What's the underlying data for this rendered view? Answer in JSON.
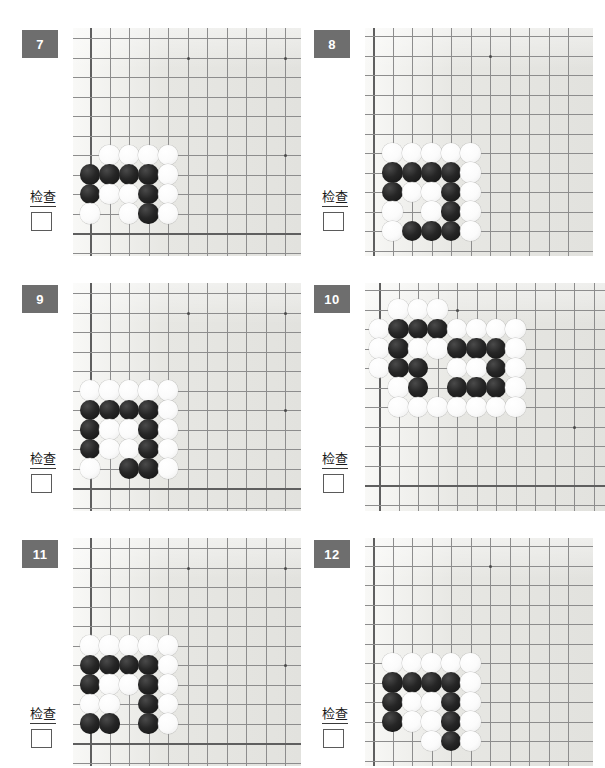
{
  "page": {
    "background_color": "#ffffff",
    "board_color": "#e9e9e6",
    "badge_color": "#6e6e6e",
    "stone_black_color": "#1a1a1a",
    "stone_white_color": "#fbfbfb",
    "grid_line_color": "#8d8d8d",
    "check_label": "检查",
    "columns": 2,
    "rows": 3
  },
  "panels": [
    {
      "id": "panel-7",
      "number": "7",
      "check_label": "检查",
      "checkbox_checked": false,
      "board": {
        "left": 73,
        "top": 28,
        "width": 228,
        "height": 228,
        "cell": 19.5,
        "origin_x": 17,
        "origin_y": 10,
        "cols": 11,
        "rows": 11,
        "edge_left": true,
        "edge_top": false,
        "edge_right": false,
        "edge_bottom": true,
        "edge_left_col": 0,
        "edge_bottom_row": 10,
        "stars": [
          [
            5,
            1
          ],
          [
            10,
            1
          ],
          [
            10,
            6
          ]
        ]
      },
      "stones": [
        {
          "c": 1,
          "r": 6,
          "color": "white"
        },
        {
          "c": 2,
          "r": 6,
          "color": "white"
        },
        {
          "c": 3,
          "r": 6,
          "color": "white"
        },
        {
          "c": 4,
          "r": 6,
          "color": "white"
        },
        {
          "c": 0,
          "r": 7,
          "color": "black"
        },
        {
          "c": 1,
          "r": 7,
          "color": "black"
        },
        {
          "c": 2,
          "r": 7,
          "color": "black"
        },
        {
          "c": 3,
          "r": 7,
          "color": "black"
        },
        {
          "c": 4,
          "r": 7,
          "color": "white"
        },
        {
          "c": 0,
          "r": 8,
          "color": "black"
        },
        {
          "c": 1,
          "r": 8,
          "color": "white"
        },
        {
          "c": 2,
          "r": 8,
          "color": "white"
        },
        {
          "c": 3,
          "r": 8,
          "color": "black"
        },
        {
          "c": 4,
          "r": 8,
          "color": "white"
        },
        {
          "c": 0,
          "r": 9,
          "color": "white"
        },
        {
          "c": 2,
          "r": 9,
          "color": "white"
        },
        {
          "c": 3,
          "r": 9,
          "color": "black"
        },
        {
          "c": 4,
          "r": 9,
          "color": "white"
        }
      ]
    },
    {
      "id": "panel-8",
      "number": "8",
      "check_label": "检查",
      "checkbox_checked": false,
      "board": {
        "left": 365,
        "top": 28,
        "width": 228,
        "height": 228,
        "cell": 19.5,
        "origin_x": 8,
        "origin_y": 8,
        "cols": 11,
        "rows": 11,
        "edge_left": true,
        "edge_top": false,
        "edge_right": false,
        "edge_bottom": false,
        "edge_left_col": 0,
        "edge_bottom_row": 11,
        "stars": [
          [
            6,
            1
          ]
        ]
      },
      "stones": [
        {
          "c": 1,
          "r": 6,
          "color": "white"
        },
        {
          "c": 2,
          "r": 6,
          "color": "white"
        },
        {
          "c": 3,
          "r": 6,
          "color": "white"
        },
        {
          "c": 4,
          "r": 6,
          "color": "white"
        },
        {
          "c": 5,
          "r": 6,
          "color": "white"
        },
        {
          "c": 1,
          "r": 7,
          "color": "black"
        },
        {
          "c": 2,
          "r": 7,
          "color": "black"
        },
        {
          "c": 3,
          "r": 7,
          "color": "black"
        },
        {
          "c": 4,
          "r": 7,
          "color": "black"
        },
        {
          "c": 5,
          "r": 7,
          "color": "white"
        },
        {
          "c": 1,
          "r": 8,
          "color": "black"
        },
        {
          "c": 2,
          "r": 8,
          "color": "white"
        },
        {
          "c": 3,
          "r": 8,
          "color": "white"
        },
        {
          "c": 4,
          "r": 8,
          "color": "black"
        },
        {
          "c": 5,
          "r": 8,
          "color": "white"
        },
        {
          "c": 1,
          "r": 9,
          "color": "white"
        },
        {
          "c": 3,
          "r": 9,
          "color": "white"
        },
        {
          "c": 4,
          "r": 9,
          "color": "black"
        },
        {
          "c": 5,
          "r": 9,
          "color": "white"
        },
        {
          "c": 1,
          "r": 10,
          "color": "white"
        },
        {
          "c": 2,
          "r": 10,
          "color": "black"
        },
        {
          "c": 3,
          "r": 10,
          "color": "black"
        },
        {
          "c": 4,
          "r": 10,
          "color": "black"
        },
        {
          "c": 5,
          "r": 10,
          "color": "white"
        }
      ]
    },
    {
      "id": "panel-9",
      "number": "9",
      "check_label": "检查",
      "checkbox_checked": false,
      "board": {
        "left": 73,
        "top": 283,
        "width": 228,
        "height": 228,
        "cell": 19.5,
        "origin_x": 17,
        "origin_y": 10,
        "cols": 11,
        "rows": 11,
        "edge_left": true,
        "edge_top": false,
        "edge_right": false,
        "edge_bottom": true,
        "edge_left_col": 0,
        "edge_bottom_row": 10,
        "stars": [
          [
            5,
            1
          ],
          [
            10,
            1
          ],
          [
            10,
            6
          ]
        ]
      },
      "stones": [
        {
          "c": 0,
          "r": 5,
          "color": "white"
        },
        {
          "c": 1,
          "r": 5,
          "color": "white"
        },
        {
          "c": 2,
          "r": 5,
          "color": "white"
        },
        {
          "c": 3,
          "r": 5,
          "color": "white"
        },
        {
          "c": 4,
          "r": 5,
          "color": "white"
        },
        {
          "c": 0,
          "r": 6,
          "color": "black"
        },
        {
          "c": 1,
          "r": 6,
          "color": "black"
        },
        {
          "c": 2,
          "r": 6,
          "color": "black"
        },
        {
          "c": 3,
          "r": 6,
          "color": "black"
        },
        {
          "c": 4,
          "r": 6,
          "color": "white"
        },
        {
          "c": 0,
          "r": 7,
          "color": "black"
        },
        {
          "c": 1,
          "r": 7,
          "color": "white"
        },
        {
          "c": 2,
          "r": 7,
          "color": "white"
        },
        {
          "c": 3,
          "r": 7,
          "color": "black"
        },
        {
          "c": 4,
          "r": 7,
          "color": "white"
        },
        {
          "c": 0,
          "r": 8,
          "color": "black"
        },
        {
          "c": 1,
          "r": 8,
          "color": "white"
        },
        {
          "c": 2,
          "r": 8,
          "color": "white"
        },
        {
          "c": 3,
          "r": 8,
          "color": "black"
        },
        {
          "c": 4,
          "r": 8,
          "color": "white"
        },
        {
          "c": 0,
          "r": 9,
          "color": "white"
        },
        {
          "c": 2,
          "r": 9,
          "color": "black"
        },
        {
          "c": 3,
          "r": 9,
          "color": "black"
        },
        {
          "c": 4,
          "r": 9,
          "color": "white"
        }
      ]
    },
    {
      "id": "panel-10",
      "number": "10",
      "check_label": "检查",
      "checkbox_checked": false,
      "board": {
        "left": 365,
        "top": 283,
        "width": 240,
        "height": 228,
        "cell": 19.5,
        "origin_x": 14,
        "origin_y": 7,
        "cols": 12,
        "rows": 11,
        "edge_left": true,
        "edge_top": false,
        "edge_right": false,
        "edge_bottom": true,
        "edge_left_col": 0,
        "edge_bottom_row": 10,
        "stars": [
          [
            4,
            1
          ],
          [
            10,
            7
          ]
        ]
      },
      "stones": [
        {
          "c": 1,
          "r": 1,
          "color": "white"
        },
        {
          "c": 2,
          "r": 1,
          "color": "white"
        },
        {
          "c": 3,
          "r": 1,
          "color": "white"
        },
        {
          "c": 0,
          "r": 2,
          "color": "white"
        },
        {
          "c": 1,
          "r": 2,
          "color": "black"
        },
        {
          "c": 2,
          "r": 2,
          "color": "black"
        },
        {
          "c": 3,
          "r": 2,
          "color": "black"
        },
        {
          "c": 4,
          "r": 2,
          "color": "white"
        },
        {
          "c": 5,
          "r": 2,
          "color": "white"
        },
        {
          "c": 6,
          "r": 2,
          "color": "white"
        },
        {
          "c": 7,
          "r": 2,
          "color": "white"
        },
        {
          "c": 0,
          "r": 3,
          "color": "white"
        },
        {
          "c": 1,
          "r": 3,
          "color": "black"
        },
        {
          "c": 2,
          "r": 3,
          "color": "white"
        },
        {
          "c": 3,
          "r": 3,
          "color": "white"
        },
        {
          "c": 4,
          "r": 3,
          "color": "black"
        },
        {
          "c": 5,
          "r": 3,
          "color": "black"
        },
        {
          "c": 6,
          "r": 3,
          "color": "black"
        },
        {
          "c": 7,
          "r": 3,
          "color": "white"
        },
        {
          "c": 0,
          "r": 4,
          "color": "white"
        },
        {
          "c": 1,
          "r": 4,
          "color": "black"
        },
        {
          "c": 2,
          "r": 4,
          "color": "black"
        },
        {
          "c": 4,
          "r": 4,
          "color": "white"
        },
        {
          "c": 5,
          "r": 4,
          "color": "white"
        },
        {
          "c": 6,
          "r": 4,
          "color": "black"
        },
        {
          "c": 7,
          "r": 4,
          "color": "white"
        },
        {
          "c": 1,
          "r": 5,
          "color": "white"
        },
        {
          "c": 2,
          "r": 5,
          "color": "black"
        },
        {
          "c": 4,
          "r": 5,
          "color": "black"
        },
        {
          "c": 5,
          "r": 5,
          "color": "black"
        },
        {
          "c": 6,
          "r": 5,
          "color": "black"
        },
        {
          "c": 7,
          "r": 5,
          "color": "white"
        },
        {
          "c": 1,
          "r": 6,
          "color": "white"
        },
        {
          "c": 2,
          "r": 6,
          "color": "white"
        },
        {
          "c": 3,
          "r": 6,
          "color": "white"
        },
        {
          "c": 4,
          "r": 6,
          "color": "white"
        },
        {
          "c": 5,
          "r": 6,
          "color": "white"
        },
        {
          "c": 6,
          "r": 6,
          "color": "white"
        },
        {
          "c": 7,
          "r": 6,
          "color": "white"
        }
      ]
    },
    {
      "id": "panel-11",
      "number": "11",
      "check_label": "检查",
      "checkbox_checked": false,
      "board": {
        "left": 73,
        "top": 538,
        "width": 228,
        "height": 228,
        "cell": 19.5,
        "origin_x": 17,
        "origin_y": 10,
        "cols": 11,
        "rows": 11,
        "edge_left": true,
        "edge_top": false,
        "edge_right": false,
        "edge_bottom": true,
        "edge_left_col": 0,
        "edge_bottom_row": 10,
        "stars": [
          [
            5,
            1
          ],
          [
            10,
            1
          ],
          [
            10,
            6
          ]
        ]
      },
      "stones": [
        {
          "c": 0,
          "r": 5,
          "color": "white"
        },
        {
          "c": 1,
          "r": 5,
          "color": "white"
        },
        {
          "c": 2,
          "r": 5,
          "color": "white"
        },
        {
          "c": 3,
          "r": 5,
          "color": "white"
        },
        {
          "c": 4,
          "r": 5,
          "color": "white"
        },
        {
          "c": 0,
          "r": 6,
          "color": "black"
        },
        {
          "c": 1,
          "r": 6,
          "color": "black"
        },
        {
          "c": 2,
          "r": 6,
          "color": "black"
        },
        {
          "c": 3,
          "r": 6,
          "color": "black"
        },
        {
          "c": 4,
          "r": 6,
          "color": "white"
        },
        {
          "c": 0,
          "r": 7,
          "color": "black"
        },
        {
          "c": 1,
          "r": 7,
          "color": "white"
        },
        {
          "c": 2,
          "r": 7,
          "color": "white"
        },
        {
          "c": 3,
          "r": 7,
          "color": "black"
        },
        {
          "c": 4,
          "r": 7,
          "color": "white"
        },
        {
          "c": 0,
          "r": 8,
          "color": "white"
        },
        {
          "c": 1,
          "r": 8,
          "color": "white"
        },
        {
          "c": 3,
          "r": 8,
          "color": "black"
        },
        {
          "c": 4,
          "r": 8,
          "color": "white"
        },
        {
          "c": 0,
          "r": 9,
          "color": "black"
        },
        {
          "c": 1,
          "r": 9,
          "color": "black"
        },
        {
          "c": 3,
          "r": 9,
          "color": "black"
        },
        {
          "c": 4,
          "r": 9,
          "color": "white"
        }
      ]
    },
    {
      "id": "panel-12",
      "number": "12",
      "check_label": "检查",
      "checkbox_checked": false,
      "board": {
        "left": 365,
        "top": 538,
        "width": 228,
        "height": 228,
        "cell": 19.5,
        "origin_x": 8,
        "origin_y": 8,
        "cols": 11,
        "rows": 11,
        "edge_left": true,
        "edge_top": false,
        "edge_right": false,
        "edge_bottom": false,
        "edge_left_col": 0,
        "edge_bottom_row": 11,
        "stars": [
          [
            6,
            1
          ]
        ]
      },
      "stones": [
        {
          "c": 1,
          "r": 6,
          "color": "white"
        },
        {
          "c": 2,
          "r": 6,
          "color": "white"
        },
        {
          "c": 3,
          "r": 6,
          "color": "white"
        },
        {
          "c": 4,
          "r": 6,
          "color": "white"
        },
        {
          "c": 5,
          "r": 6,
          "color": "white"
        },
        {
          "c": 1,
          "r": 7,
          "color": "black"
        },
        {
          "c": 2,
          "r": 7,
          "color": "black"
        },
        {
          "c": 3,
          "r": 7,
          "color": "black"
        },
        {
          "c": 4,
          "r": 7,
          "color": "black"
        },
        {
          "c": 5,
          "r": 7,
          "color": "white"
        },
        {
          "c": 1,
          "r": 8,
          "color": "black"
        },
        {
          "c": 2,
          "r": 8,
          "color": "white"
        },
        {
          "c": 3,
          "r": 8,
          "color": "white"
        },
        {
          "c": 4,
          "r": 8,
          "color": "black"
        },
        {
          "c": 5,
          "r": 8,
          "color": "white"
        },
        {
          "c": 1,
          "r": 9,
          "color": "black"
        },
        {
          "c": 2,
          "r": 9,
          "color": "white"
        },
        {
          "c": 3,
          "r": 9,
          "color": "white"
        },
        {
          "c": 4,
          "r": 9,
          "color": "black"
        },
        {
          "c": 5,
          "r": 9,
          "color": "white"
        },
        {
          "c": 3,
          "r": 10,
          "color": "white"
        },
        {
          "c": 4,
          "r": 10,
          "color": "black"
        },
        {
          "c": 5,
          "r": 10,
          "color": "white"
        }
      ]
    }
  ],
  "layout": {
    "badges": [
      {
        "left": 22,
        "top": 30
      },
      {
        "left": 314,
        "top": 30
      },
      {
        "left": 22,
        "top": 285
      },
      {
        "left": 314,
        "top": 285
      },
      {
        "left": 22,
        "top": 540
      },
      {
        "left": 314,
        "top": 540
      }
    ],
    "check_labels": [
      {
        "left": 30,
        "top": 190
      },
      {
        "left": 322,
        "top": 190
      },
      {
        "left": 30,
        "top": 452
      },
      {
        "left": 322,
        "top": 452
      },
      {
        "left": 30,
        "top": 707
      },
      {
        "left": 322,
        "top": 707
      }
    ],
    "check_boxes": [
      {
        "left": 31,
        "top": 212
      },
      {
        "left": 323,
        "top": 212
      },
      {
        "left": 31,
        "top": 474
      },
      {
        "left": 323,
        "top": 474
      },
      {
        "left": 31,
        "top": 729
      },
      {
        "left": 323,
        "top": 729
      }
    ]
  }
}
